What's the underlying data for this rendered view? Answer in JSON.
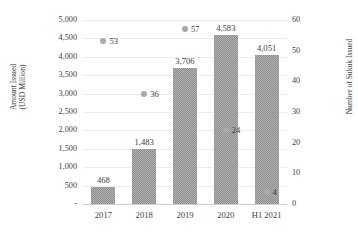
{
  "chart_data": {
    "type": "bar",
    "title": "",
    "subtitle": "",
    "xlabel": "",
    "ylabel": "Amount Issued (USD Million)",
    "ylabel_line1": "Amount Issued",
    "ylabel_line2": "(USD Million)",
    "y2label": "Number of Sukuk Issued",
    "categories": [
      "2017",
      "2018",
      "2019",
      "2020",
      "H1 2021"
    ],
    "grid": true,
    "legend": "none",
    "ylim": [
      0,
      5000
    ],
    "y2lim": [
      0,
      60
    ],
    "ytick_labels": [
      "5,000",
      "4,500",
      "4,000",
      "3,500",
      "3,000",
      "2,500",
      "2,000",
      "1,500",
      "1,000",
      "500",
      "-"
    ],
    "ytick_values": [
      5000,
      4500,
      4000,
      3500,
      3000,
      2500,
      2000,
      1500,
      1000,
      500,
      0
    ],
    "y2tick_labels": [
      "60",
      "50",
      "40",
      "30",
      "20",
      "10",
      "0"
    ],
    "y2tick_values": [
      60,
      50,
      40,
      30,
      20,
      10,
      0
    ],
    "series": [
      {
        "name": "Amount Issued (USD Million)",
        "type": "bar",
        "axis": "left",
        "color": "#8d8d8d",
        "values": [
          468,
          1483,
          3706,
          4583,
          4051
        ],
        "data_labels": [
          "468",
          "1,483",
          "3,706",
          "4,583",
          "4,051"
        ]
      },
      {
        "name": "Number of Sukuk Issued",
        "type": "scatter",
        "axis": "right",
        "color": "#a9a9a9",
        "values": [
          53,
          36,
          57,
          24,
          4
        ],
        "data_labels": [
          "53",
          "36",
          "57",
          "24",
          "4"
        ]
      }
    ]
  },
  "colors": {
    "bar": "#8d8d8d",
    "marker": "#a9a9a9",
    "gridline": "#ededed",
    "axis": "#cfcfcf",
    "text": "#3d3d3d",
    "background": "#ffffff"
  }
}
